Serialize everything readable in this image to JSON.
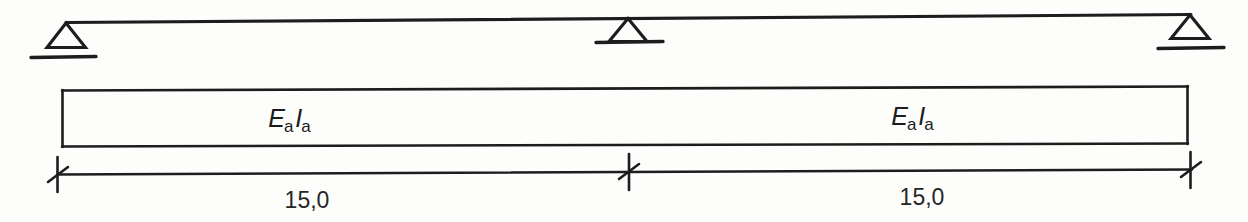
{
  "diagram": {
    "background_color": "#fdfdfc",
    "line_color": "#1d1d1d",
    "beam": {
      "spans": [
        {
          "stiffness_symbol": "E",
          "stiffness_subscript": "a",
          "inertia_symbol": "I",
          "inertia_subscript": "a",
          "dimension": "15,0"
        },
        {
          "stiffness_symbol": "E",
          "stiffness_subscript": "a",
          "inertia_symbol": "I",
          "inertia_subscript": "a",
          "dimension": "15,0"
        }
      ]
    },
    "supports": [
      {
        "name": "left-support",
        "type": "triangle-on-ground-line"
      },
      {
        "name": "middle-support",
        "type": "triangle-on-ground-line"
      },
      {
        "name": "right-support",
        "type": "triangle-on-ground-line"
      }
    ],
    "dimension_line": {
      "tick_style": "slash",
      "total_label": "15,0 + 15,0"
    }
  }
}
